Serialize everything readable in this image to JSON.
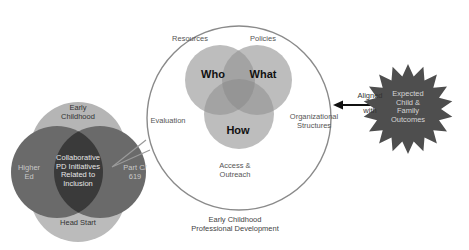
{
  "diagram": {
    "colors": {
      "inner_venn_fill": "#b3b3b3",
      "left_venn_fill": "#5a5a5a",
      "left_venn_outer": "#b0b0b0",
      "left_venn_center": "#333333",
      "starburst_fill": "#4d4d4d",
      "big_circle_stroke": "#808080",
      "arrow": "#111111"
    },
    "professional_development": {
      "caption_line1": "Early Childhood",
      "caption_line2": "Professional Development",
      "venn": {
        "who": "Who",
        "what": "What",
        "how": "How"
      },
      "surrounding_labels": {
        "resources": "Resources",
        "policies": "Policies",
        "evaluation": "Evaluation",
        "org_line1": "Organizational",
        "org_line2": "Structures",
        "access_line1": "Access &",
        "access_line2": "Outreach"
      }
    },
    "collaborative_venn": {
      "top": {
        "line1": "Early",
        "line2": "Childhood"
      },
      "left": {
        "line1": "Higher",
        "line2": "Ed"
      },
      "right": {
        "line1": "Part C/",
        "line2": "619"
      },
      "bottom": "Head Start",
      "center": {
        "line1": "Collaborative",
        "line2": "PD Initiatives",
        "line3": "Related to",
        "line4": "Inclusion"
      }
    },
    "connector": {
      "line1": "Aligned",
      "line2": "with"
    },
    "outcomes": {
      "line1": "Expected",
      "line2": "Child &",
      "line3": "Family",
      "line4": "Outcomes"
    }
  }
}
